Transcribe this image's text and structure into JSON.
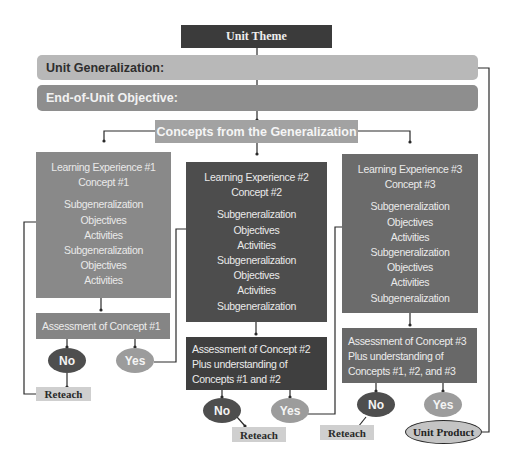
{
  "diagram": {
    "unit_theme": "Unit Theme",
    "unit_generalization": "Unit Generalization:",
    "end_of_unit_objective": "End-of-Unit Objective:",
    "concepts_from_generalization": "Concepts from the Generalization",
    "learning_experiences": [
      {
        "title": "Learning Experience #1",
        "concept": "Concept #1",
        "items": [
          "Subgeneralization",
          "Objectives",
          "Activities",
          "Subgeneralization",
          "Objectives",
          "Activities"
        ]
      },
      {
        "title": "Learning Experience #2",
        "concept": "Concept #2",
        "items": [
          "Subgeneralization",
          "Objectives",
          "Activities",
          "Subgeneralization",
          "Objectives",
          "Activities",
          "Subgeneralization"
        ]
      },
      {
        "title": "Learning Experience #3",
        "concept": "Concept #3",
        "items": [
          "Subgeneralization",
          "Objectives",
          "Activities",
          "Subgeneralization",
          "Objectives",
          "Activities",
          "Subgeneralization"
        ]
      }
    ],
    "assessments": [
      {
        "lines": [
          "Assessment of Concept #1"
        ]
      },
      {
        "lines": [
          "Assessment of Concept #2",
          "Plus understanding of",
          "Concepts #1 and #2"
        ]
      },
      {
        "lines": [
          "Assessment of Concept #3",
          "Plus understanding of",
          "Concepts #1, #2, and #3"
        ]
      }
    ],
    "decisions": {
      "no": "No",
      "yes": "Yes"
    },
    "reteach": "Reteach",
    "unit_product": "Unit Product"
  },
  "colors": {
    "theme": "#3b3b3b",
    "generalization": "#b8b8b8",
    "objective": "#8e8e8e",
    "concepts": "#a2a2a2",
    "le1": "#898989",
    "le2": "#4d4d4d",
    "le3": "#6b6b6b",
    "no": "#4e4e4e",
    "yes": "#9c9c9c",
    "reteach": "#cfcfcf",
    "line": "#2a2a2a"
  }
}
